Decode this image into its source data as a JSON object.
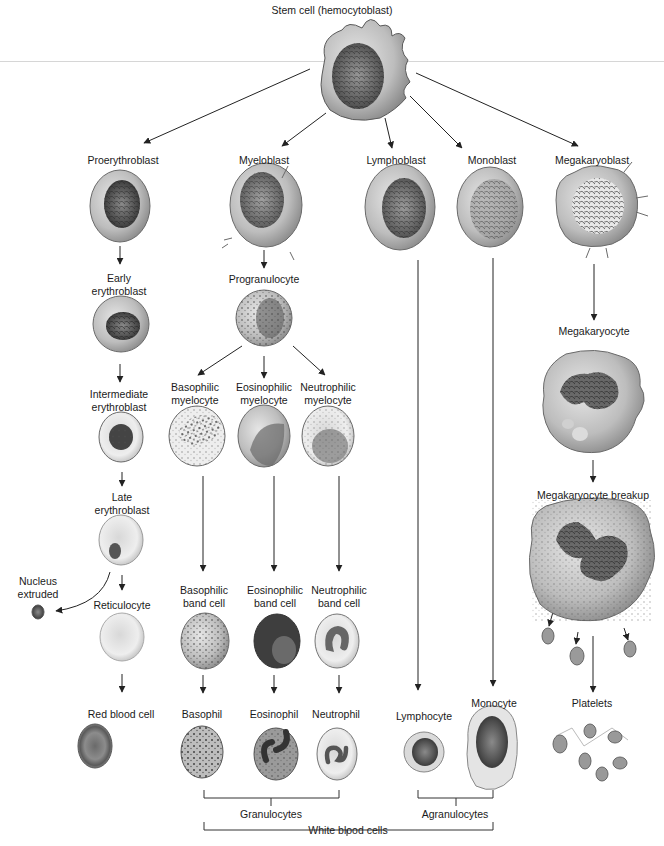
{
  "title": "Stem cell (hemocytoblast)",
  "blasts": [
    {
      "id": "proerythroblast",
      "label": "Proerythroblast"
    },
    {
      "id": "myeloblast",
      "label": "Myeloblast"
    },
    {
      "id": "lymphoblast",
      "label": "Lymphoblast"
    },
    {
      "id": "monoblast",
      "label": "Monoblast"
    },
    {
      "id": "megakaryoblast",
      "label": "Megakaryoblast"
    }
  ],
  "erythroid": {
    "early": [
      "Early",
      "erythroblast"
    ],
    "intermediate": [
      "Intermediate",
      "erythroblast"
    ],
    "late": [
      "Late",
      "erythroblast"
    ],
    "nucleus_extruded": [
      "Nucleus",
      "extruded"
    ],
    "reticulocyte": "Reticulocyte",
    "rbc": "Red blood cell"
  },
  "myeloid": {
    "progranulocyte": "Progranulocyte",
    "myelocytes": [
      [
        "Basophilic",
        "myelocyte"
      ],
      [
        "Eosinophilic",
        "myelocyte"
      ],
      [
        "Neutrophilic",
        "myelocyte"
      ]
    ],
    "band_cells": [
      [
        "Basophilic",
        "band cell"
      ],
      [
        "Eosinophilic",
        "band cell"
      ],
      [
        "Neutrophilic",
        "band cell"
      ]
    ],
    "mature": [
      "Basophil",
      "Eosinophil",
      "Neutrophil"
    ]
  },
  "lymphoid": {
    "mature": "Lymphocyte"
  },
  "monocytic": {
    "mature": "Monocyte"
  },
  "megakaryocytic": {
    "megakaryocyte": "Megakaryocyte",
    "breakup": "Megakaryocyte breakup",
    "platelets": "Platelets"
  },
  "groups": {
    "granulocytes": "Granulocytes",
    "agranulocytes": "Agranulocytes",
    "white_blood_cells": "White blood cells"
  },
  "colors": {
    "background": "#ffffff",
    "text": "#1a1a1a",
    "arrow": "#222222",
    "cell_fill": "#c8c8c8",
    "cell_edge": "#6a6a6a",
    "nucleus": "#4a4a4a"
  }
}
